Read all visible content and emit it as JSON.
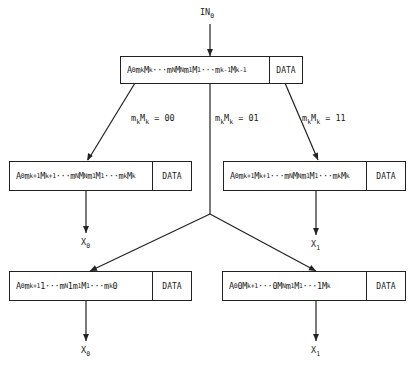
{
  "diagram": {
    "type": "flow-tree",
    "input": {
      "label": "IN",
      "sub": "0"
    },
    "data_label": "DATA",
    "boxes": {
      "top": {
        "parts": [
          [
            "A",
            "0"
          ],
          [
            "m",
            "k"
          ],
          [
            "M",
            "k"
          ],
          [
            "···",
            ""
          ],
          [
            "m",
            "N"
          ],
          [
            "M",
            "N"
          ],
          [
            "m",
            "1"
          ],
          [
            "M",
            "1"
          ],
          [
            "···",
            ""
          ],
          [
            "m",
            "k-1"
          ],
          [
            "M",
            "k-1"
          ]
        ]
      },
      "mid_left": {
        "parts": [
          [
            "A",
            "0"
          ],
          [
            "m",
            "k+1"
          ],
          [
            "M",
            "k+1"
          ],
          [
            "···",
            ""
          ],
          [
            "m",
            "N"
          ],
          [
            "M",
            "N"
          ],
          [
            "m",
            "1"
          ],
          [
            "M",
            "1"
          ],
          [
            "···",
            ""
          ],
          [
            "m",
            "k"
          ],
          [
            "M",
            "k"
          ]
        ]
      },
      "mid_right": {
        "parts": [
          [
            "A",
            "0"
          ],
          [
            "m",
            "k+1"
          ],
          [
            "M",
            "k+1"
          ],
          [
            "···",
            ""
          ],
          [
            "m",
            "N"
          ],
          [
            "M",
            "N"
          ],
          [
            "m",
            "1"
          ],
          [
            "M",
            "1"
          ],
          [
            "···",
            ""
          ],
          [
            "m",
            "k"
          ],
          [
            "M",
            "k"
          ]
        ]
      },
      "bottom_left": {
        "parts": [
          [
            "A",
            "0"
          ],
          [
            "m",
            "k+1"
          ],
          [
            "1",
            ""
          ],
          [
            "···",
            ""
          ],
          [
            "m",
            "N"
          ],
          [
            "1",
            ""
          ],
          [
            "m",
            "1"
          ],
          [
            "M",
            "1"
          ],
          [
            "···",
            ""
          ],
          [
            "m",
            "k"
          ],
          [
            "0",
            ""
          ]
        ]
      },
      "bottom_right": {
        "parts": [
          [
            "A",
            "0"
          ],
          [
            "0",
            ""
          ],
          [
            "M",
            "k+1"
          ],
          [
            "···",
            ""
          ],
          [
            "0",
            ""
          ],
          [
            "M",
            "N"
          ],
          [
            "m",
            "1"
          ],
          [
            "M",
            "1"
          ],
          [
            "···",
            ""
          ],
          [
            "1",
            ""
          ],
          [
            "M",
            "k"
          ]
        ]
      }
    },
    "branch_labels": {
      "left": {
        "pre": "m",
        "pre_sub": "k",
        "mid": "M",
        "mid_sub": "k",
        "value": " = 00"
      },
      "center": {
        "pre": "m",
        "pre_sub": "k",
        "mid": "M",
        "mid_sub": "k",
        "value": " = 01"
      },
      "right": {
        "pre": "m",
        "pre_sub": "k",
        "mid": "M",
        "mid_sub": "k",
        "value": " = 11"
      }
    },
    "outputs": {
      "mid_left": {
        "label": "X",
        "sub": "0"
      },
      "mid_right": {
        "label": "X",
        "sub": "1"
      },
      "bottom_left": {
        "label": "X",
        "sub": "0"
      },
      "bottom_right": {
        "label": "X",
        "sub": "1"
      }
    }
  }
}
